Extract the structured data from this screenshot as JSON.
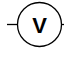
{
  "diagram": {
    "component": "voltmeter",
    "symbol_label": "V",
    "stroke_color": "#000000",
    "background": "#ffffff"
  }
}
